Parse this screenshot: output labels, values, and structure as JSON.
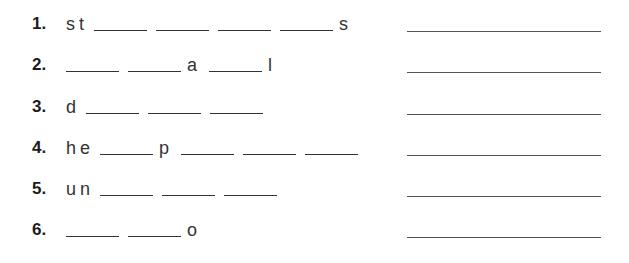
{
  "worksheet": {
    "items": [
      {
        "number": "1.",
        "parts": [
          "s",
          "t",
          "_",
          "_",
          "_",
          "_",
          "s"
        ],
        "answer": ""
      },
      {
        "number": "2.",
        "parts": [
          "_",
          "_",
          "a",
          "_",
          "l"
        ],
        "answer": ""
      },
      {
        "number": "3.",
        "parts": [
          "d",
          "_",
          "_",
          "_"
        ],
        "answer": ""
      },
      {
        "number": "4.",
        "parts": [
          "h",
          "e",
          "_",
          "p",
          "_",
          "_",
          "_"
        ],
        "answer": ""
      },
      {
        "number": "5.",
        "parts": [
          "u",
          "n",
          "_",
          "_",
          "_"
        ],
        "answer": ""
      },
      {
        "number": "6.",
        "parts": [
          "_",
          "_",
          "o"
        ],
        "answer": ""
      }
    ]
  }
}
